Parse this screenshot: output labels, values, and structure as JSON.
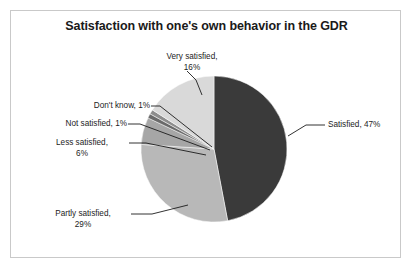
{
  "figure": {
    "title": "Satisfaction with one's own behavior in the GDR",
    "background": "#ffffff",
    "frame_color": "#c9c9c9"
  },
  "chart_data": {
    "type": "pie",
    "title": "Satisfaction with one's own behavior in the GDR",
    "xlabel": "",
    "ylabel": "",
    "units": "percent",
    "total": 100,
    "start_angle_deg": 0,
    "direction": "clockwise",
    "legend": "none (direct labels with leader lines)",
    "grid": false,
    "categories": [
      "Satisfied",
      "Partly satisfied",
      "Less satisfied",
      "Not satisfied",
      "Don't know",
      "Very satisfied"
    ],
    "values": [
      47,
      29,
      6,
      1,
      1,
      16
    ],
    "colors": [
      "#3a3a3a",
      "#b8b8b8",
      "#a6a6a6",
      "#6a6a6a",
      "#8d8d8d",
      "#d9d9d9"
    ],
    "slices": [
      {
        "label": "Satisfied",
        "value": 47,
        "value_text": "47%",
        "annotation": "Satisfied, 47%",
        "color": "#3a3a3a"
      },
      {
        "label": "Partly satisfied",
        "value": 29,
        "value_text": "29%",
        "annotation": "Partly satisfied, 29%",
        "color": "#b8b8b8"
      },
      {
        "label": "Less satisfied",
        "value": 6,
        "value_text": "6%",
        "annotation": "Less satisfied, 6%",
        "color": "#a6a6a6"
      },
      {
        "label": "Not satisfied",
        "value": 1,
        "value_text": "1%",
        "annotation": "Not satisfied, 1%",
        "color": "#6a6a6a"
      },
      {
        "label": "Don't know",
        "value": 1,
        "value_text": "1%",
        "annotation": "Don't know, 1%",
        "color": "#8d8d8d"
      },
      {
        "label": "Very satisfied",
        "value": 16,
        "value_text": "16%",
        "annotation": "Very satisfied, 16%",
        "color": "#d9d9d9"
      }
    ]
  },
  "labels": {
    "very_satisfied_line1": "Very satisfied,",
    "very_satisfied_line2": "16%",
    "dont_know": "Don't know, 1%",
    "not_satisfied": "Not satisfied, 1%",
    "less_satisfied_line1": "Less satisfied,",
    "less_satisfied_line2": "6%",
    "partly_satisfied_line1": "Partly satisfied,",
    "partly_satisfied_line2": "29%",
    "satisfied": "Satisfied, 47%"
  }
}
